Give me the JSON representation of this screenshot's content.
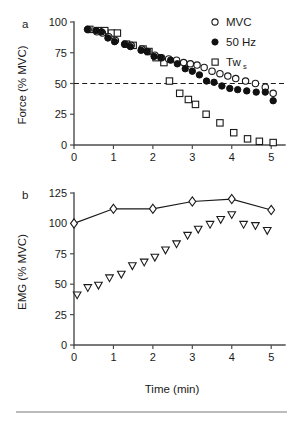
{
  "figure": {
    "panel_a_letter": "a",
    "panel_b_letter": "b",
    "bottom_rule": true
  },
  "legend": {
    "mvc": "MVC",
    "fifty_hz": "50 Hz",
    "tw_main": "Tw",
    "tw_sub": "s"
  },
  "chart_data": [
    {
      "type": "scatter",
      "panel": "a",
      "title": "",
      "xlabel": "",
      "ylabel": "Force (% MVC)",
      "xlim": [
        0,
        5.35
      ],
      "ylim": [
        0,
        100
      ],
      "xticks": [
        0,
        1,
        2,
        3,
        4,
        5
      ],
      "xticklabels": [
        "0",
        "1",
        "2",
        "3",
        "4",
        "5"
      ],
      "yticks": [
        0,
        25,
        50,
        75,
        100
      ],
      "yticklabels": [
        "0",
        "25",
        "50",
        "75",
        "100"
      ],
      "grid": false,
      "legend_position": "top-right",
      "annotations": [
        {
          "type": "hline",
          "y": 50,
          "style": "dashed",
          "label": "50% MVC reference"
        }
      ],
      "series": [
        {
          "name": "MVC",
          "marker": "open-circle",
          "x": [
            0.36,
            0.58,
            0.72,
            0.88,
            1.05,
            1.3,
            1.45,
            1.72,
            1.87,
            2.05,
            2.22,
            2.4,
            2.6,
            2.78,
            2.95,
            3.12,
            3.3,
            3.5,
            3.7,
            3.9,
            4.1,
            4.35,
            4.6,
            4.85,
            5.05
          ],
          "y": [
            94,
            92,
            91,
            88,
            85,
            82,
            81,
            78,
            76,
            73,
            71,
            70,
            69,
            67,
            66,
            65,
            63,
            60,
            58,
            56,
            54,
            52,
            50,
            47,
            42
          ]
        },
        {
          "name": "50 Hz",
          "marker": "filled-circle",
          "x": [
            0.34,
            0.56,
            0.7,
            0.86,
            1.03,
            1.28,
            1.43,
            1.7,
            1.85,
            2.03,
            2.2,
            2.45,
            2.62,
            2.82,
            3.0,
            3.18,
            3.36,
            3.55,
            3.75,
            3.95,
            4.15,
            4.38,
            4.62,
            4.85,
            5.05
          ],
          "y": [
            94,
            93,
            92,
            87,
            84,
            82,
            80,
            77,
            76,
            72,
            71,
            69,
            66,
            62,
            60,
            57,
            52,
            51,
            48,
            46,
            45,
            44,
            43,
            43,
            36
          ]
        },
        {
          "name": "Tws",
          "marker": "open-square",
          "x": [
            0.4,
            0.6,
            0.78,
            0.95,
            1.1,
            1.33,
            1.5,
            1.75,
            1.9,
            2.08,
            2.28,
            2.42,
            2.68,
            2.9,
            3.08,
            3.35,
            3.7,
            4.05,
            4.4,
            4.7,
            5.05
          ],
          "y": [
            94,
            93,
            93,
            91,
            91,
            82,
            81,
            78,
            76,
            71,
            67,
            52,
            42,
            37,
            33,
            25,
            18,
            10,
            5,
            3,
            2
          ]
        }
      ]
    },
    {
      "type": "line",
      "panel": "b",
      "title": "",
      "xlabel": "Time (min)",
      "ylabel": "EMG (% MVC)",
      "xlim": [
        0,
        5.35
      ],
      "ylim": [
        0,
        125
      ],
      "xticks": [
        0,
        1,
        2,
        3,
        4,
        5
      ],
      "xticklabels": [
        "0",
        "1",
        "2",
        "3",
        "4",
        "5"
      ],
      "yticks": [
        0,
        25,
        50,
        75,
        100,
        125
      ],
      "yticklabels": [
        "0",
        "25",
        "50",
        "75",
        "100",
        "125"
      ],
      "grid": false,
      "legend_position": "none",
      "series": [
        {
          "name": "MVC EMG",
          "marker": "open-diamond",
          "connected": true,
          "x": [
            0,
            1,
            2,
            3,
            4,
            5
          ],
          "y": [
            100,
            112,
            112,
            118,
            120,
            111
          ]
        },
        {
          "name": "Submaximal EMG",
          "marker": "open-down-triangle",
          "connected": false,
          "x": [
            0.08,
            0.35,
            0.62,
            0.9,
            1.2,
            1.48,
            1.78,
            2.05,
            2.32,
            2.6,
            2.88,
            3.15,
            3.45,
            3.72,
            4.0,
            4.3,
            4.6,
            4.9
          ],
          "y": [
            41,
            47,
            49,
            55,
            58,
            65,
            68,
            72,
            78,
            83,
            90,
            95,
            99,
            103,
            107,
            99,
            98,
            94
          ]
        }
      ]
    }
  ]
}
